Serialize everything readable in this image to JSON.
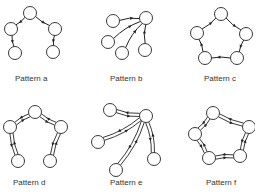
{
  "figure": {
    "node_radius": 6.5,
    "stroke": "#222222",
    "fill": "#ffffff",
    "patterns": [
      {
        "id": "a",
        "label": "Pattern a",
        "label_pos": [
          15,
          74
        ],
        "nodes": [
          [
            30,
            13
          ],
          [
            11,
            29
          ],
          [
            55,
            29
          ],
          [
            15,
            53
          ],
          [
            53,
            52
          ]
        ],
        "edges": [
          {
            "from": 1,
            "to": 0,
            "dir": "to-from",
            "double": false
          },
          {
            "from": 0,
            "to": 2,
            "dir": "forward",
            "double": false
          },
          {
            "from": 1,
            "to": 3,
            "dir": "forward",
            "double": false
          },
          {
            "from": 2,
            "to": 4,
            "dir": "forward",
            "double": false
          }
        ]
      },
      {
        "id": "b",
        "label": "Pattern b",
        "label_pos": [
          110,
          74
        ],
        "nodes": [
          [
            146,
            18
          ],
          [
            113,
            21
          ],
          [
            108,
            42
          ],
          [
            122,
            53
          ],
          [
            145,
            50
          ]
        ],
        "edges": [
          {
            "from": 1,
            "to": 0,
            "dir": "forward",
            "double": false
          },
          {
            "from": 2,
            "to": 0,
            "dir": "forward",
            "double": false
          },
          {
            "from": 3,
            "to": 0,
            "dir": "forward",
            "double": false
          },
          {
            "from": 4,
            "to": 0,
            "dir": "forward",
            "double": false
          }
        ]
      },
      {
        "id": "c",
        "label": "Pattern c",
        "label_pos": [
          204,
          74
        ],
        "nodes": [
          [
            221,
            14
          ],
          [
            246,
            34
          ],
          [
            237,
            58
          ],
          [
            205,
            58
          ],
          [
            197,
            33
          ]
        ],
        "edges": [
          {
            "from": 0,
            "to": 1,
            "dir": "forward",
            "double": false
          },
          {
            "from": 1,
            "to": 2,
            "dir": "forward",
            "double": false
          },
          {
            "from": 2,
            "to": 3,
            "dir": "forward",
            "double": false
          },
          {
            "from": 3,
            "to": 4,
            "dir": "forward",
            "double": false
          },
          {
            "from": 4,
            "to": 0,
            "dir": "forward",
            "double": false
          }
        ]
      },
      {
        "id": "d",
        "label": "Pattern d",
        "label_pos": [
          13,
          178
        ],
        "nodes": [
          [
            35,
            112
          ],
          [
            10,
            127
          ],
          [
            61,
            127
          ],
          [
            18,
            161
          ],
          [
            50,
            161
          ]
        ],
        "edges": [
          {
            "from": 0,
            "to": 1,
            "dir": "both",
            "double": true
          },
          {
            "from": 0,
            "to": 2,
            "dir": "both",
            "double": true
          },
          {
            "from": 1,
            "to": 3,
            "dir": "both",
            "double": true
          },
          {
            "from": 2,
            "to": 4,
            "dir": "both",
            "double": true
          }
        ]
      },
      {
        "id": "e",
        "label": "Pattern e",
        "label_pos": [
          110,
          178
        ],
        "nodes": [
          [
            146,
            116
          ],
          [
            110,
            110
          ],
          [
            98,
            142
          ],
          [
            116,
            170
          ],
          [
            154,
            159
          ]
        ],
        "edges": [
          {
            "from": 0,
            "to": 1,
            "dir": "both",
            "double": true
          },
          {
            "from": 0,
            "to": 2,
            "dir": "both",
            "double": true
          },
          {
            "from": 0,
            "to": 3,
            "dir": "both",
            "double": true
          },
          {
            "from": 0,
            "to": 4,
            "dir": "both",
            "double": true
          }
        ]
      },
      {
        "id": "f",
        "label": "Pattern f",
        "label_pos": [
          206,
          178
        ],
        "nodes": [
          [
            213,
            113
          ],
          [
            249,
            127
          ],
          [
            240,
            156
          ],
          [
            209,
            158
          ],
          [
            195,
            134
          ]
        ],
        "edges": [
          {
            "from": 0,
            "to": 1,
            "dir": "both",
            "double": true
          },
          {
            "from": 1,
            "to": 2,
            "dir": "both",
            "double": true
          },
          {
            "from": 2,
            "to": 3,
            "dir": "both",
            "double": true
          },
          {
            "from": 3,
            "to": 4,
            "dir": "both",
            "double": true
          },
          {
            "from": 4,
            "to": 0,
            "dir": "both",
            "double": true
          }
        ]
      }
    ]
  }
}
